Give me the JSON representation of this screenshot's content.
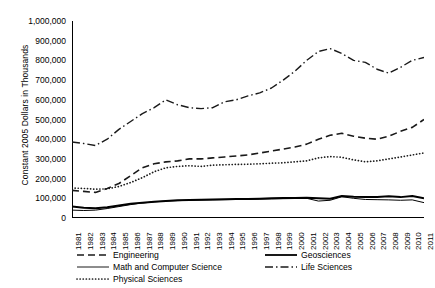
{
  "axes": {
    "ylabel": "Constant 2005 Dollars in Thousands",
    "yticks": [
      "1,000,000",
      "900,000",
      "800,000",
      "700,000",
      "600,000",
      "500,000",
      "400,000",
      "300,000",
      "200,000",
      "100,000",
      "0"
    ]
  },
  "legend": {
    "items": [
      {
        "label": "Engineering",
        "style": "dashed"
      },
      {
        "label": "Geosciences",
        "style": "solid-thick"
      },
      {
        "label": "Math and Computer Science",
        "style": "solid-thin"
      },
      {
        "label": "Life Sciences",
        "style": "dash-dot"
      },
      {
        "label": "Physical Sciences",
        "style": "dotted"
      }
    ]
  },
  "chart_data": {
    "type": "line",
    "title": "",
    "xlabel": "",
    "ylabel": "Constant 2005 Dollars in Thousands",
    "ylim": [
      0,
      1000000
    ],
    "ytick_step": 100000,
    "grid": false,
    "legend_position": "bottom",
    "x": [
      1981,
      1982,
      1983,
      1984,
      1985,
      1986,
      1987,
      1988,
      1989,
      1990,
      1991,
      1992,
      1993,
      1994,
      1995,
      1996,
      1997,
      1998,
      1999,
      2000,
      2001,
      2002,
      2003,
      2004,
      2005,
      2006,
      2007,
      2008,
      2009,
      2010,
      2011
    ],
    "series": [
      {
        "name": "Engineering",
        "color": "#1a1a1a",
        "style": "dashed",
        "values": [
          140000,
          135000,
          130000,
          150000,
          175000,
          215000,
          255000,
          275000,
          285000,
          290000,
          300000,
          300000,
          305000,
          310000,
          315000,
          320000,
          330000,
          340000,
          350000,
          360000,
          375000,
          400000,
          420000,
          430000,
          415000,
          405000,
          400000,
          415000,
          440000,
          460000,
          500000
        ]
      },
      {
        "name": "Geosciences",
        "color": "#000000",
        "style": "solid-thick",
        "values": [
          58000,
          52000,
          50000,
          55000,
          63000,
          72000,
          78000,
          82000,
          86000,
          90000,
          92000,
          93000,
          94000,
          95000,
          96000,
          97000,
          98000,
          100000,
          101000,
          102000,
          103000,
          100000,
          98000,
          112000,
          108000,
          106000,
          107000,
          110000,
          106000,
          112000,
          100000
        ]
      },
      {
        "name": "Math and Computer Science",
        "color": "#000000",
        "style": "solid-thin",
        "values": [
          40000,
          38000,
          40000,
          48000,
          58000,
          68000,
          76000,
          82000,
          86000,
          88000,
          90000,
          91000,
          92000,
          93000,
          94000,
          95000,
          96000,
          97000,
          98000,
          99000,
          100000,
          86000,
          90000,
          108000,
          100000,
          94000,
          93000,
          92000,
          90000,
          92000,
          78000
        ]
      },
      {
        "name": "Life Sciences",
        "color": "#1a1a1a",
        "style": "dash-dot",
        "values": [
          386000,
          378000,
          368000,
          400000,
          450000,
          490000,
          530000,
          560000,
          600000,
          575000,
          560000,
          555000,
          560000,
          590000,
          600000,
          620000,
          635000,
          660000,
          700000,
          745000,
          800000,
          845000,
          860000,
          835000,
          800000,
          790000,
          755000,
          735000,
          765000,
          800000,
          815000
        ]
      },
      {
        "name": "Physical Sciences",
        "color": "#1a1a1a",
        "style": "dotted",
        "values": [
          152000,
          150000,
          146000,
          148000,
          160000,
          180000,
          205000,
          235000,
          255000,
          262000,
          265000,
          262000,
          268000,
          270000,
          272000,
          273000,
          275000,
          278000,
          280000,
          285000,
          290000,
          305000,
          312000,
          308000,
          295000,
          285000,
          290000,
          300000,
          310000,
          320000,
          330000
        ]
      }
    ]
  }
}
